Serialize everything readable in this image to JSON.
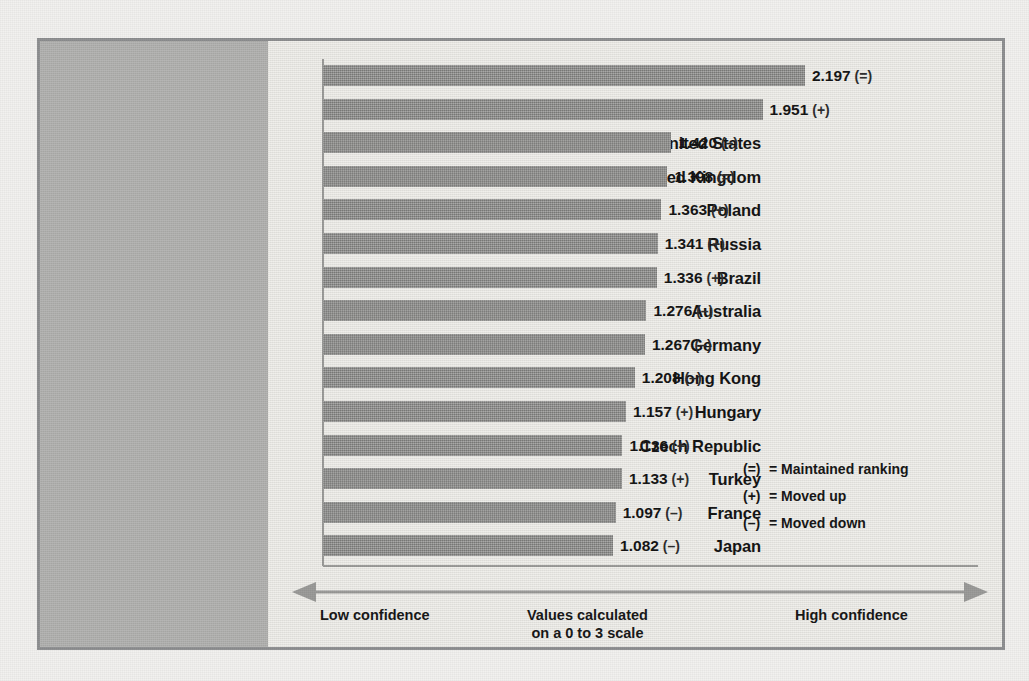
{
  "chart_data": {
    "type": "bar",
    "orientation": "horizontal",
    "title": "",
    "xlabel": "",
    "ylabel": "",
    "xlim": [
      0,
      3
    ],
    "grid": false,
    "scale_note": "Values calculated on a 0 to 3 scale",
    "categories": [
      "China",
      "India",
      "United States",
      "United Kingdom",
      "Poland",
      "Russia",
      "Brazil",
      "Australia",
      "Germany",
      "Hong Kong",
      "Hungary",
      "Czech Republic",
      "Turkey",
      "France",
      "Japan"
    ],
    "values": [
      2.197,
      1.951,
      1.42,
      1.398,
      1.363,
      1.341,
      1.336,
      1.276,
      1.267,
      1.208,
      1.157,
      1.136,
      1.133,
      1.097,
      1.082
    ],
    "value_labels": [
      "2.197",
      "1.951",
      "1.420",
      "1.398",
      "1.363",
      "1.341",
      "1.336",
      "1.276",
      "1.267",
      "1.208",
      "1.157",
      "1.136",
      "1.133",
      "1.097",
      "1.082"
    ],
    "markers": [
      "(=)",
      "(+)",
      "(–)",
      "(=)",
      "(+)",
      "(+)",
      "(+)",
      "(–)",
      "(–)",
      "(–)",
      "(+)",
      "(+)",
      "(+)",
      "(–)",
      "(–)"
    ],
    "bar_color": "#8d8d8b",
    "panel_color": "#b2b2b0"
  },
  "axis": {
    "low_label": "Low confidence",
    "high_label": "High confidence",
    "mid_label_line1": "Values calculated",
    "mid_label_line2": "on a 0 to 3 scale"
  },
  "legend": {
    "items": [
      {
        "symbol": "(=)",
        "equals": "=",
        "text": "Maintained ranking"
      },
      {
        "symbol": "(+)",
        "equals": "=",
        "text": "Moved up"
      },
      {
        "symbol": "(–)",
        "equals": "=",
        "text": "Moved down"
      }
    ]
  }
}
